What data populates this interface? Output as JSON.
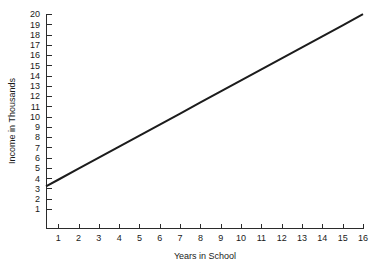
{
  "chart_data": {
    "type": "line",
    "title": "",
    "xlabel": "Years in School",
    "ylabel": "Income in Thousands",
    "xlim": [
      0.4,
      16
    ],
    "ylim": [
      0,
      20
    ],
    "grid": false,
    "legend": false,
    "x_ticks": [
      1,
      2,
      3,
      4,
      5,
      6,
      7,
      8,
      9,
      10,
      11,
      12,
      13,
      14,
      15,
      16
    ],
    "x_tick_labels": [
      "1",
      "2",
      "3",
      "4",
      "5",
      "6",
      "7",
      "8",
      "9",
      "10",
      "11",
      "12",
      "13",
      "14",
      "15",
      "16"
    ],
    "y_ticks": [
      1,
      2,
      3,
      4,
      5,
      6,
      7,
      8,
      9,
      10,
      11,
      12,
      13,
      14,
      15,
      16,
      17,
      18,
      19,
      20
    ],
    "y_tick_labels": [
      "1",
      "2",
      "3",
      "4",
      "5",
      "6",
      "7",
      "8",
      "9",
      "10",
      "11",
      "12",
      "13",
      "14",
      "15",
      "16",
      "17",
      "18",
      "19",
      "20"
    ],
    "series": [
      {
        "name": "Income",
        "color": "#1c1c1c",
        "x": [
          0.4,
          1,
          2,
          3,
          4,
          5,
          6,
          7,
          8,
          9,
          10,
          11,
          12,
          13,
          14,
          15,
          16
        ],
        "values": [
          3.2,
          3.85,
          4.93,
          6.0,
          7.08,
          8.15,
          9.23,
          10.3,
          11.38,
          12.45,
          13.53,
          14.6,
          15.68,
          16.75,
          17.83,
          18.9,
          19.98
        ]
      }
    ],
    "background_color": "#ffffff",
    "axis_color": "#2b2b2b",
    "text_color": "#1a1a1a"
  }
}
